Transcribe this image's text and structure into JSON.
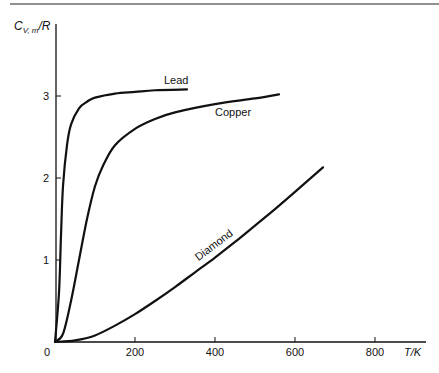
{
  "chart_data": {
    "type": "line",
    "title": "",
    "xlabel": "T/K",
    "ylabel": "C_V,m/R",
    "xlim": [
      0,
      920
    ],
    "ylim": [
      0,
      3.5
    ],
    "x_ticks": [
      0,
      200,
      400,
      600,
      800
    ],
    "y_ticks": [
      1,
      2,
      3
    ],
    "grid": false,
    "legend": "inline labels on curves",
    "series": [
      {
        "name": "Lead",
        "x": [
          0,
          10,
          15,
          20,
          30,
          40,
          60,
          80,
          100,
          150,
          200,
          250,
          330
        ],
        "y": [
          0,
          0.6,
          1.3,
          1.9,
          2.4,
          2.65,
          2.85,
          2.93,
          2.98,
          3.03,
          3.05,
          3.07,
          3.08
        ]
      },
      {
        "name": "Copper",
        "x": [
          0,
          20,
          40,
          60,
          80,
          100,
          120,
          150,
          200,
          250,
          300,
          400,
          500,
          560
        ],
        "y": [
          0,
          0.1,
          0.5,
          1.0,
          1.5,
          1.9,
          2.15,
          2.4,
          2.6,
          2.72,
          2.8,
          2.9,
          2.97,
          3.02
        ]
      },
      {
        "name": "Diamond",
        "x": [
          0,
          50,
          100,
          150,
          200,
          250,
          300,
          350,
          400,
          450,
          500,
          550,
          600,
          670
        ],
        "y": [
          0,
          0.02,
          0.08,
          0.2,
          0.34,
          0.5,
          0.67,
          0.85,
          1.03,
          1.22,
          1.42,
          1.62,
          1.83,
          2.13
        ]
      }
    ]
  },
  "labels": {
    "y_axis": "C",
    "y_axis_sub": "V, m",
    "y_axis_rest": "/R",
    "x_axis": "T/K",
    "origin": "0",
    "x_tick_labels": [
      "200",
      "400",
      "600",
      "800"
    ],
    "y_tick_labels": [
      "1",
      "2",
      "3"
    ],
    "lead": "Lead",
    "copper": "Copper",
    "diamond": "Diamond"
  }
}
